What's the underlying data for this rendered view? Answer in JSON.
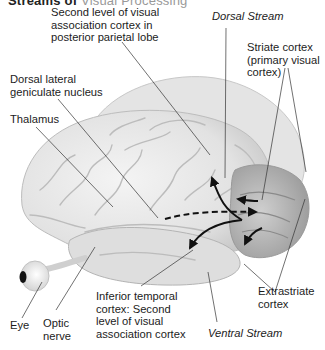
{
  "figure": {
    "cropped_heading": {
      "bold": "Streams of",
      "light": "Visual Processing"
    },
    "labels": {
      "second_level_parietal": [
        "Second level of visual",
        "association cortex in",
        "posterior parietal lobe"
      ],
      "dorsal_stream": "Dorsal Stream",
      "striate_cortex": [
        "Striate cortex",
        "(primary visual",
        "cortex)"
      ],
      "dorsal_lateral_geniculate": [
        "Dorsal lateral",
        "geniculate nucleus"
      ],
      "thalamus": "Thalamus",
      "extrastriate_cortex": [
        "Extrastriate",
        "cortex"
      ],
      "eye": "Eye",
      "optic_nerve": [
        "Optic",
        "nerve"
      ],
      "inferior_temporal": [
        "Inferior temporal",
        "cortex: Second",
        "level of visual",
        "association cortex"
      ],
      "ventral_stream": "Ventral Stream"
    },
    "colors": {
      "brain_light": "#ececec",
      "brain_mid": "#d4d4d4",
      "brain_shadow": "#a8a8a8",
      "occipital": "#bdbdbd",
      "arrow": "#111111",
      "leader_line": "#333333"
    }
  }
}
